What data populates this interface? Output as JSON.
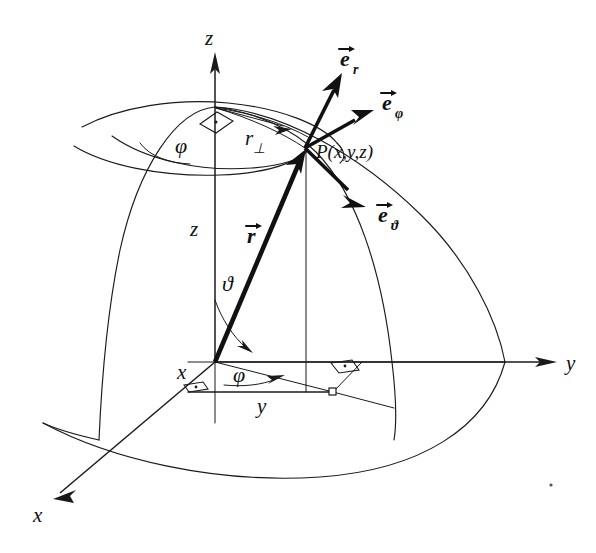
{
  "figure": {
    "background_color": "#ffffff",
    "ink_color": "#111111",
    "width": 596,
    "height": 553
  },
  "axes": {
    "z": {
      "label": "z",
      "name": "z-axis",
      "direction": "up"
    },
    "y": {
      "label": "y",
      "name": "y-axis",
      "direction": "right"
    },
    "x": {
      "label": "x",
      "name": "x-axis",
      "direction": "lower-left"
    }
  },
  "point": {
    "label": "P(x,y,z)",
    "name": "point-P"
  },
  "vectors": {
    "position": {
      "letter": "r",
      "label": "r",
      "name": "position-vector-r"
    },
    "e_r": {
      "letter": "e",
      "subscript": "r",
      "name": "unit-vector-e-r"
    },
    "e_phi": {
      "letter": "e",
      "subscript": "φ",
      "name": "unit-vector-e-phi"
    },
    "e_theta": {
      "letter": "e",
      "subscript": "ϑ",
      "name": "unit-vector-e-theta"
    }
  },
  "angles": {
    "phi_top": {
      "label": "φ",
      "name": "azimuth-angle-phi-top"
    },
    "phi_bottom": {
      "label": "φ",
      "name": "azimuth-angle-phi-bottom"
    },
    "theta": {
      "label": "ϑ",
      "name": "polar-angle-theta"
    }
  },
  "lengths": {
    "r_perp": {
      "letter": "r",
      "subscript": "⊥",
      "name": "radial-projection-r-perp"
    },
    "z": {
      "label": "z",
      "name": "height-z"
    },
    "x": {
      "label": "x",
      "name": "x-component"
    },
    "y": {
      "label": "y",
      "name": "y-component"
    }
  }
}
